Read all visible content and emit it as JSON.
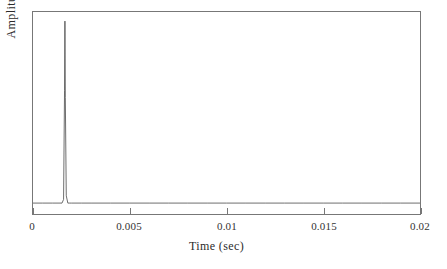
{
  "figure": {
    "background_color": "#ffffff",
    "axis_color": "#777777",
    "trace_color": "#4a4a4a"
  },
  "axes": {
    "xlabel": "Time  (sec)",
    "ylabel": "Amplitude",
    "x_ticks": [
      "0",
      "0.005",
      "0.01",
      "0.015",
      "0.02"
    ],
    "y_ticks": []
  },
  "chart_data": {
    "type": "line",
    "title": "",
    "xlabel": "Time  (sec)",
    "ylabel": "Amplitude",
    "xlim": [
      0,
      0.02
    ],
    "ylim": [
      -0.06,
      1.05
    ],
    "xticks": [
      0,
      0.005,
      0.01,
      0.015,
      0.02
    ],
    "xticklabels": [
      "0",
      "0.005",
      "0.01",
      "0.015",
      "0.02"
    ],
    "yticks": [],
    "yticklabels": [],
    "grid": false,
    "legend": null,
    "annotations": [],
    "series": [
      {
        "name": "impulse response",
        "color": "#4a4a4a",
        "linewidth": 0.8,
        "description": "Flat zero baseline across the full 0 to 0.02 s window with a single narrow positive impulse near t = 0.00165 s reaching full amplitude.",
        "x": [
          0.0,
          0.0005,
          0.001,
          0.0015,
          0.00158,
          0.00163,
          0.00165,
          0.00167,
          0.00172,
          0.0018,
          0.0019,
          0.002,
          0.0025,
          0.003,
          0.004,
          0.005,
          0.006,
          0.007,
          0.008,
          0.009,
          0.01,
          0.011,
          0.012,
          0.013,
          0.014,
          0.015,
          0.016,
          0.017,
          0.018,
          0.019,
          0.02
        ],
        "y": [
          0.0,
          0.0,
          0.0,
          0.0,
          0.02,
          0.62,
          1.0,
          0.58,
          0.04,
          0.0,
          0.0,
          0.0,
          0.0,
          0.0,
          0.0,
          0.0,
          0.0,
          0.0,
          0.0,
          0.0,
          0.0,
          0.0,
          0.0,
          0.0,
          0.0,
          0.0,
          0.0,
          0.0,
          0.0,
          0.0,
          0.0
        ]
      }
    ],
    "peak": {
      "time_sec": 0.00165,
      "amplitude_normalized": 1.0
    }
  }
}
